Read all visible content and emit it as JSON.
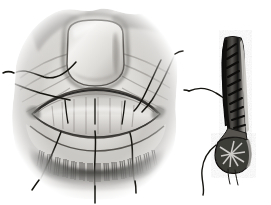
{
  "figure": {
    "medium": "grayscale halftone engraving",
    "background_color": "#ffffff",
    "ink_color": "#1a1a1a",
    "canvas": {
      "width": 271,
      "height": 205
    },
    "panels": [
      {
        "id": "panel-main",
        "name": "everted-eyelid-anterior-view",
        "caption": "",
        "bounds": {
          "x": 8,
          "y": 2,
          "width": 176,
          "height": 200
        },
        "parts": [
          {
            "name": "everted-tarsal-plate",
            "label": "",
            "shape": "rounded-rectangle",
            "cx": 95,
            "cy": 52,
            "rx": 30,
            "ry": 30
          },
          {
            "name": "conjunctival-surface",
            "label": "",
            "shape": "lenticular",
            "cx": 95,
            "cy": 112,
            "rx": 63,
            "ry": 22
          },
          {
            "name": "horizontal-tarsal-incision",
            "label": "",
            "shape": "arc",
            "cx": 95,
            "cy": 104,
            "rx": 60,
            "ry": 14
          },
          {
            "name": "lower-lid-margin",
            "label": "",
            "shape": "arc",
            "cx": 95,
            "cy": 148,
            "rx": 66,
            "ry": 20
          },
          {
            "name": "eyelash-row",
            "label": "",
            "count": 64,
            "y": 150,
            "length": 16
          },
          {
            "name": "skin-fold-shading",
            "label": "",
            "shape": "radiating-creases"
          },
          {
            "name": "vignette-edge",
            "label": "",
            "shape": "irregular-oval-fade"
          }
        ],
        "sutures": [
          {
            "name": "suture-upper-left",
            "points": "14,73 30,70 46,77 62,71 76,62"
          },
          {
            "name": "suture-mid-left",
            "points": "4,80 22,86 40,92 56,96 68,99"
          },
          {
            "name": "suture-upper-right",
            "points": "161,60 153,74 146,88 139,101 134,110"
          },
          {
            "name": "suture-lower-right",
            "points": "174,54 166,70 159,86 150,100 142,112"
          },
          {
            "name": "suture-vert-1",
            "points": "65,101 66,112 68,122"
          },
          {
            "name": "suture-vert-2",
            "points": "95,100 95,112 95,123"
          },
          {
            "name": "suture-vert-3",
            "points": "125,102 124,113 122,123"
          },
          {
            "name": "suture-drop-left",
            "points": "60,133 54,150 46,168 38,182"
          },
          {
            "name": "suture-drop-mid",
            "points": "95,131 96,150 93,170 95,188"
          },
          {
            "name": "suture-drop-right",
            "points": "130,133 134,150 131,168 134,182"
          }
        ]
      },
      {
        "id": "panel-section",
        "name": "eyelid-sagittal-cross-section",
        "caption": "",
        "bounds": {
          "x": 188,
          "y": 34,
          "width": 80,
          "height": 168
        },
        "parts": [
          {
            "name": "tarsal-plate-section",
            "label": "",
            "shape": "elongated-strip",
            "x": 222,
            "y": 38,
            "width": 26,
            "height": 96
          },
          {
            "name": "meibomian-glands",
            "label": "",
            "count": 11,
            "shape": "diagonal-striations"
          },
          {
            "name": "conjunctival-lining",
            "label": "",
            "shape": "dark-border-strip"
          },
          {
            "name": "lid-margin-bulb",
            "label": "",
            "shape": "oval-mass",
            "cx": 231,
            "cy": 155,
            "rx": 16,
            "ry": 14
          },
          {
            "name": "lash-follicles",
            "label": "",
            "count": 3,
            "shape": "short-hairs"
          },
          {
            "name": "skin-surface-line",
            "label": "",
            "shape": "outer-contour"
          }
        ],
        "sutures": [
          {
            "name": "section-suture-upper",
            "points": "190,91 204,88 216,93 224,98"
          },
          {
            "name": "section-suture-lower",
            "points": "214,146 205,156 201,170 206,182 203,193"
          },
          {
            "name": "section-lash-a",
            "points": "229,168 230,180"
          },
          {
            "name": "section-lash-b",
            "points": "236,169 238,181"
          }
        ]
      }
    ]
  }
}
